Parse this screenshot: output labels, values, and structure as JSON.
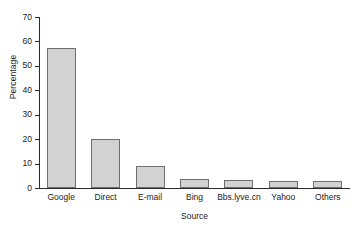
{
  "chart_data": {
    "type": "bar",
    "title": "",
    "subtitle": "",
    "xlabel": "Source",
    "ylabel": "Percentage",
    "categories": [
      "Google",
      "Direct",
      "E-mail",
      "Bing",
      "Bbs.lyve.cn",
      "Yahoo",
      "Others"
    ],
    "values": [
      57.5,
      20.1,
      9.0,
      3.6,
      3.3,
      3.0,
      3.0
    ],
    "ylim": [
      0,
      70
    ],
    "yticks": [
      0,
      10,
      20,
      30,
      40,
      50,
      60,
      70
    ],
    "ytick_labels": [
      "0",
      "10",
      "20",
      "30",
      "40",
      "50",
      "60",
      "70"
    ],
    "grid": false,
    "legend": null,
    "legend_position": "none",
    "bar_fill_color": "#d2d2d2",
    "bar_border_color": "#6e6e6e",
    "axis_color": "#2b2b2b",
    "background_color": "#ffffff"
  }
}
